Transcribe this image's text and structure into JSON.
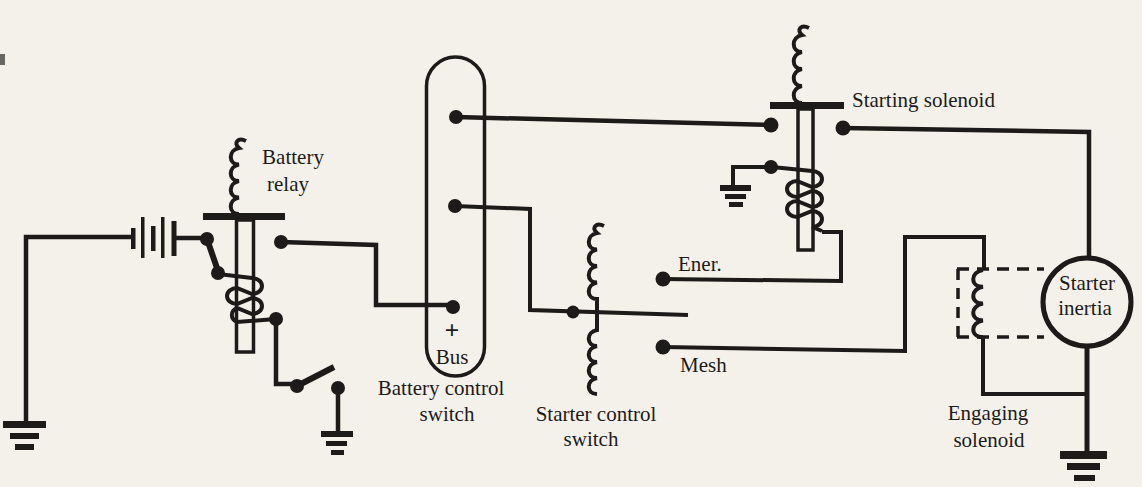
{
  "figure": {
    "type": "electrical-schematic",
    "ink_color": "#1d1b19",
    "paper_color": "#f4f1ea",
    "labels": {
      "battery_relay": {
        "line1": "Battery",
        "line2": "relay"
      },
      "battery_control_switch": {
        "line1": "Battery control",
        "line2": "switch"
      },
      "bus": {
        "plus": "+",
        "name": "Bus"
      },
      "starter_control_switch": {
        "line1": "Starter control",
        "line2": "switch"
      },
      "energize_contact": "Ener.",
      "mesh_contact": "Mesh",
      "starting_solenoid": "Starting solenoid",
      "engaging_solenoid": {
        "line1": "Engaging",
        "line2": "solenoid"
      },
      "starter_inertia": {
        "line1": "Starter",
        "line2": "inertia"
      }
    }
  }
}
